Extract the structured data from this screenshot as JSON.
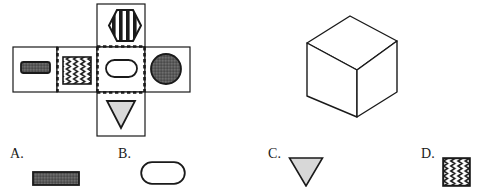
{
  "page": {
    "type": "spatial-reasoning-question",
    "background_color": "#ffffff"
  },
  "colors": {
    "stroke": "#1a1a1a",
    "dark_fill": "#5a5a5a",
    "light_fill": "#d8d8d8",
    "white_fill": "#ffffff",
    "pattern_stroke": "#1a1a1a"
  },
  "net": {
    "name": "cube-unfolded-net",
    "faces": [
      {
        "id": "net-face-top",
        "position": "top",
        "symbol": "striped-hexagon",
        "symbol_fill": "#ffffff",
        "pattern": "vertical-stripes"
      },
      {
        "id": "net-face-left",
        "position": "middle-left-1",
        "symbol": "filled-rounded-bar",
        "symbol_fill": "#5a5a5a",
        "pattern": "solid"
      },
      {
        "id": "net-face-left2",
        "position": "middle-left-2",
        "symbol": "zigzag-square",
        "symbol_fill": "#ffffff",
        "pattern": "vertical-zigzag"
      },
      {
        "id": "net-face-center",
        "position": "middle-center",
        "symbol": "rounded-pill",
        "symbol_fill": "#ffffff",
        "pattern": "none"
      },
      {
        "id": "net-face-right",
        "position": "middle-right",
        "symbol": "filled-circle",
        "symbol_fill": "#5a5a5a",
        "pattern": "solid"
      },
      {
        "id": "net-face-bottom",
        "position": "bottom",
        "symbol": "down-triangle",
        "symbol_fill": "#d8d8d8",
        "pattern": "none"
      }
    ],
    "center_face_border_style": "dashed"
  },
  "cube": {
    "name": "3d-cube",
    "faces_visible": [
      "top",
      "front",
      "right"
    ],
    "fill": "#ffffff",
    "stroke": "#1a1a1a"
  },
  "options": [
    {
      "key": "A",
      "label": "A.",
      "shape": "filled-rectangle",
      "fill": "#5a5a5a"
    },
    {
      "key": "B",
      "label": "B.",
      "shape": "rounded-pill",
      "fill": "#ffffff"
    },
    {
      "key": "C",
      "label": "C.",
      "shape": "down-triangle",
      "fill": "#d8d8d8"
    },
    {
      "key": "D",
      "label": "D.",
      "shape": "zigzag-square",
      "fill": "#ffffff"
    }
  ]
}
